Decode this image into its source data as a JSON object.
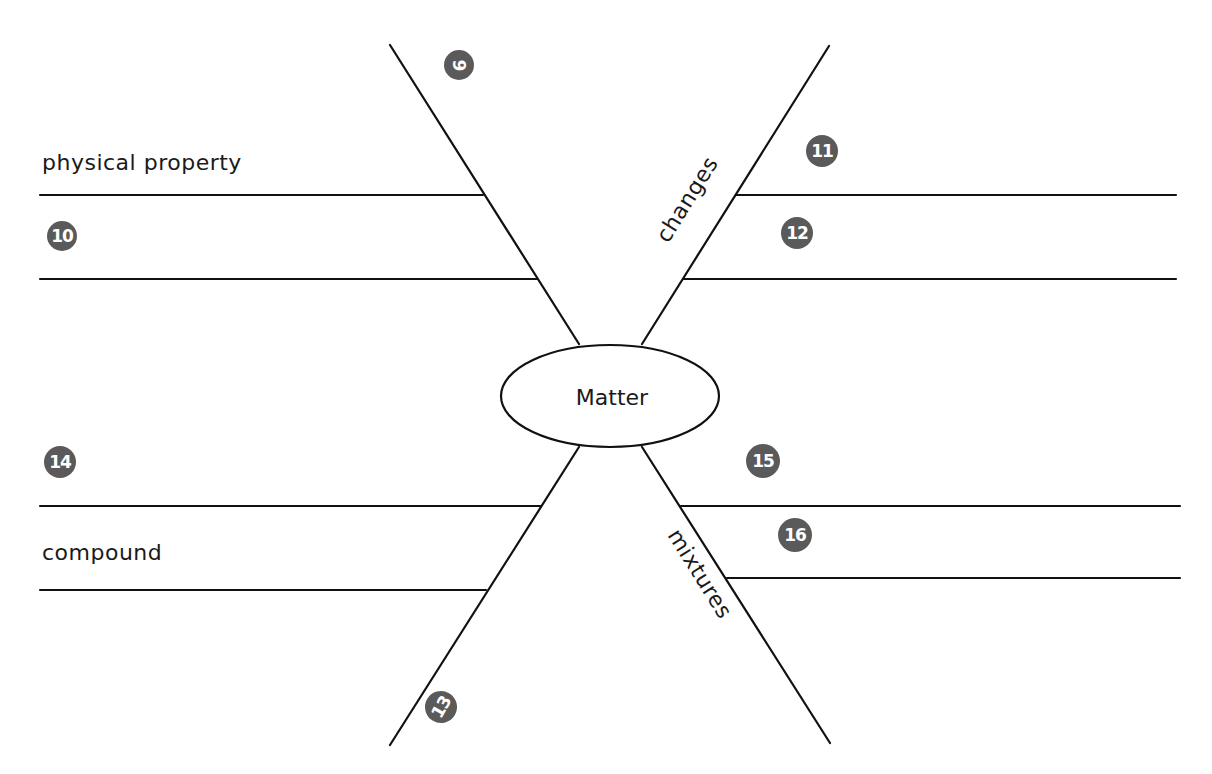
{
  "diagram": {
    "type": "spider-map",
    "center": {
      "label": "Matter"
    },
    "colors": {
      "line": "#111111",
      "badge": "#5a5a5a",
      "badge_text": "#ffffff",
      "background": "#ffffff"
    },
    "legs": [
      {
        "position": "upper-left",
        "badge": "9",
        "leg_label": "",
        "branches": [
          {
            "badge": "",
            "text": "physical property"
          },
          {
            "badge": "10",
            "text": ""
          }
        ]
      },
      {
        "position": "upper-right",
        "badge": "",
        "leg_label": "changes",
        "branches": [
          {
            "badge": "11",
            "text": ""
          },
          {
            "badge": "12",
            "text": ""
          }
        ]
      },
      {
        "position": "lower-left",
        "badge": "13",
        "leg_label": "",
        "branches": [
          {
            "badge": "14",
            "text": ""
          },
          {
            "badge": "",
            "text": "compound"
          }
        ]
      },
      {
        "position": "lower-right",
        "badge": "",
        "leg_label": "mixtures",
        "branches": [
          {
            "badge": "15",
            "text": ""
          },
          {
            "badge": "16",
            "text": ""
          }
        ]
      }
    ]
  }
}
